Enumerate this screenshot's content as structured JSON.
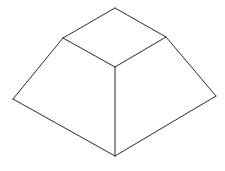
{
  "figure": {
    "stroke_color": "#2a2a2a",
    "background": "#ffffff",
    "vertices": {
      "top_back": [
        115,
        8
      ],
      "top_left": [
        63,
        38
      ],
      "top_right": [
        166,
        37
      ],
      "top_front": [
        115,
        67
      ],
      "base_left": [
        13,
        99
      ],
      "base_right": [
        216,
        96
      ],
      "base_front": [
        115,
        156
      ]
    },
    "edges": [
      [
        "top_back",
        "top_left"
      ],
      [
        "top_back",
        "top_right"
      ],
      [
        "top_left",
        "top_front"
      ],
      [
        "top_right",
        "top_front"
      ],
      [
        "top_left",
        "base_left"
      ],
      [
        "top_right",
        "base_right"
      ],
      [
        "top_front",
        "base_front"
      ],
      [
        "base_left",
        "base_front"
      ],
      [
        "base_right",
        "base_front"
      ]
    ]
  }
}
